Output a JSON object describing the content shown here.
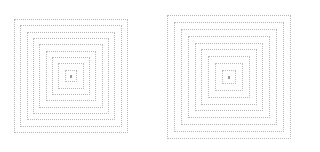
{
  "figures": [
    {
      "name": "left-concentric-squares",
      "center_x": 71,
      "center_y": 76,
      "outer_half_size": 57,
      "square_count": 9,
      "line_color": "#b8b8b8",
      "center_dot_color": "#9a9a9a"
    },
    {
      "name": "right-concentric-squares",
      "center_x": 229,
      "center_y": 77,
      "outer_half_size": 62,
      "square_count": 9,
      "line_color": "#b8b8b8",
      "center_dot_color": "#9a9a9a"
    }
  ]
}
